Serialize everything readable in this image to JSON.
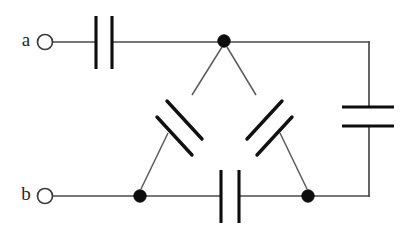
{
  "diagram": {
    "type": "electrical-schematic",
    "background_color": "#ffffff",
    "wire_color": "#4a4a4a",
    "plate_color": "#0d0d0d",
    "node_color": "#0d0d0d",
    "canvas": {
      "width": 415,
      "height": 231
    }
  },
  "terminals": [
    {
      "id": "terminal-a",
      "label": "a",
      "label_x": 26,
      "label_y": 42,
      "ring_cx": 45,
      "ring_cy": 42,
      "ring_r": 7.5
    },
    {
      "id": "terminal-b",
      "label": "b",
      "label_x": 26,
      "label_y": 196,
      "ring_cx": 45,
      "ring_cy": 196,
      "ring_r": 7.5
    }
  ],
  "nodes": [
    {
      "id": "node-top",
      "cx": 224,
      "cy": 41,
      "r": 6.2
    },
    {
      "id": "node-bottom-left",
      "cx": 140,
      "cy": 196,
      "r": 6.2
    },
    {
      "id": "node-bottom-right",
      "cx": 308,
      "cy": 196,
      "r": 6.2
    }
  ],
  "wires": [
    {
      "id": "wire-a-to-cap-top-left",
      "d": "M 53 42 L 96 42"
    },
    {
      "id": "wire-cap-top-right-to-node-top",
      "d": "M 112 42 L 224 42"
    },
    {
      "id": "wire-node-top-to-right-corner",
      "d": "M 224 42 L 369 42"
    },
    {
      "id": "wire-right-corner-down-to-cap",
      "d": "M 369 42 L 369 107"
    },
    {
      "id": "wire-cap-right-down-to-bottom",
      "d": "M 369 126 L 369 196"
    },
    {
      "id": "wire-bottom-right-corner-to-node",
      "d": "M 369 196 L 308 196"
    },
    {
      "id": "wire-node-br-to-cap-bottom-right",
      "d": "M 308 196 L 239 196"
    },
    {
      "id": "wire-cap-bottom-left-to-node-bl",
      "d": "M 221 196 L 140 196"
    },
    {
      "id": "wire-b-to-node-bottom-left",
      "d": "M 53 196 L 140 196"
    }
  ],
  "wires_diagonal": [
    {
      "id": "wire-left-leg-upper",
      "d": "M 222 47 L 192 95"
    },
    {
      "id": "wire-left-leg-lower",
      "d": "M 168 133 L 141 189"
    },
    {
      "id": "wire-right-leg-upper",
      "d": "M 227 47 L 256 95"
    },
    {
      "id": "wire-right-leg-lower",
      "d": "M 280 133 L 307 189"
    }
  ],
  "capacitors": [
    {
      "id": "capacitor-top",
      "orientation": "vertical-plates",
      "position": "top branch between terminal a and top node",
      "plate1": {
        "x1": 96,
        "y1": 16,
        "x2": 96,
        "y2": 69
      },
      "plate2": {
        "x1": 112,
        "y1": 16,
        "x2": 112,
        "y2": 69
      }
    },
    {
      "id": "capacitor-bottom",
      "orientation": "vertical-plates",
      "position": "bottom branch between bottom-left and bottom-right nodes",
      "plate1": {
        "x1": 221,
        "y1": 170,
        "x2": 221,
        "y2": 223
      },
      "plate2": {
        "x1": 239,
        "y1": 170,
        "x2": 239,
        "y2": 223
      }
    },
    {
      "id": "capacitor-right",
      "orientation": "horizontal-plates",
      "position": "right branch between top node and bottom-right node",
      "plate1": {
        "x1": 342,
        "y1": 107,
        "x2": 394,
        "y2": 107
      },
      "plate2": {
        "x1": 342,
        "y1": 126,
        "x2": 394,
        "y2": 126
      }
    },
    {
      "id": "capacitor-left-diagonal",
      "orientation": "diagonal-plates",
      "position": "left leg between top node and bottom-left node",
      "plate1": {
        "x1": 167,
        "y1": 101,
        "x2": 202,
        "y2": 139
      },
      "plate2": {
        "x1": 157,
        "y1": 117,
        "x2": 192,
        "y2": 155
      }
    },
    {
      "id": "capacitor-right-diagonal",
      "orientation": "diagonal-plates",
      "position": "right leg between top node and bottom-right node",
      "plate1": {
        "x1": 282,
        "y1": 101,
        "x2": 247,
        "y2": 139
      },
      "plate2": {
        "x1": 292,
        "y1": 117,
        "x2": 257,
        "y2": 155
      }
    }
  ]
}
